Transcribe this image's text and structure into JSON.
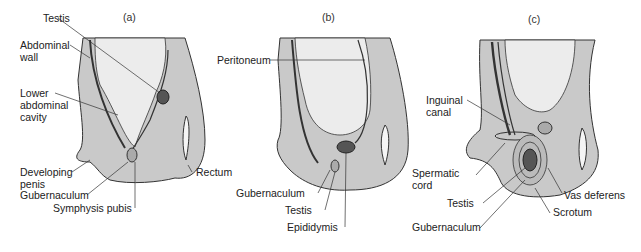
{
  "figure": {
    "panels": [
      {
        "id": "a",
        "title": "(a)",
        "labels": {
          "testis": "Testis",
          "abdominal_wall_1": "Abdominal",
          "abdominal_wall_2": "wall",
          "lower_cavity_1": "Lower",
          "lower_cavity_2": "abdominal",
          "lower_cavity_3": "cavity",
          "developing_penis_1": "Developing",
          "developing_penis_2": "penis",
          "gubernaculum": "Gubernaculum",
          "symphysis_pubis": "Symphysis pubis",
          "rectum": "Rectum"
        }
      },
      {
        "id": "b",
        "title": "(b)",
        "labels": {
          "peritoneum": "Peritoneum",
          "gubernaculum": "Gubernaculum",
          "testis": "Testis",
          "epididymis": "Epididymis"
        }
      },
      {
        "id": "c",
        "title": "(c)",
        "labels": {
          "inguinal_canal_1": "Inguinal",
          "inguinal_canal_2": "canal",
          "spermatic_cord_1": "Spermatic",
          "spermatic_cord_2": "cord",
          "testis": "Testis",
          "gubernaculum": "Gubernaculum",
          "vas_deferens": "Vas deferens",
          "scrotum": "Scrotum"
        }
      }
    ],
    "colors": {
      "tissue": "#c9c9c9",
      "cavity": "#ececec",
      "outline": "#333333",
      "testis": "#555555"
    }
  }
}
